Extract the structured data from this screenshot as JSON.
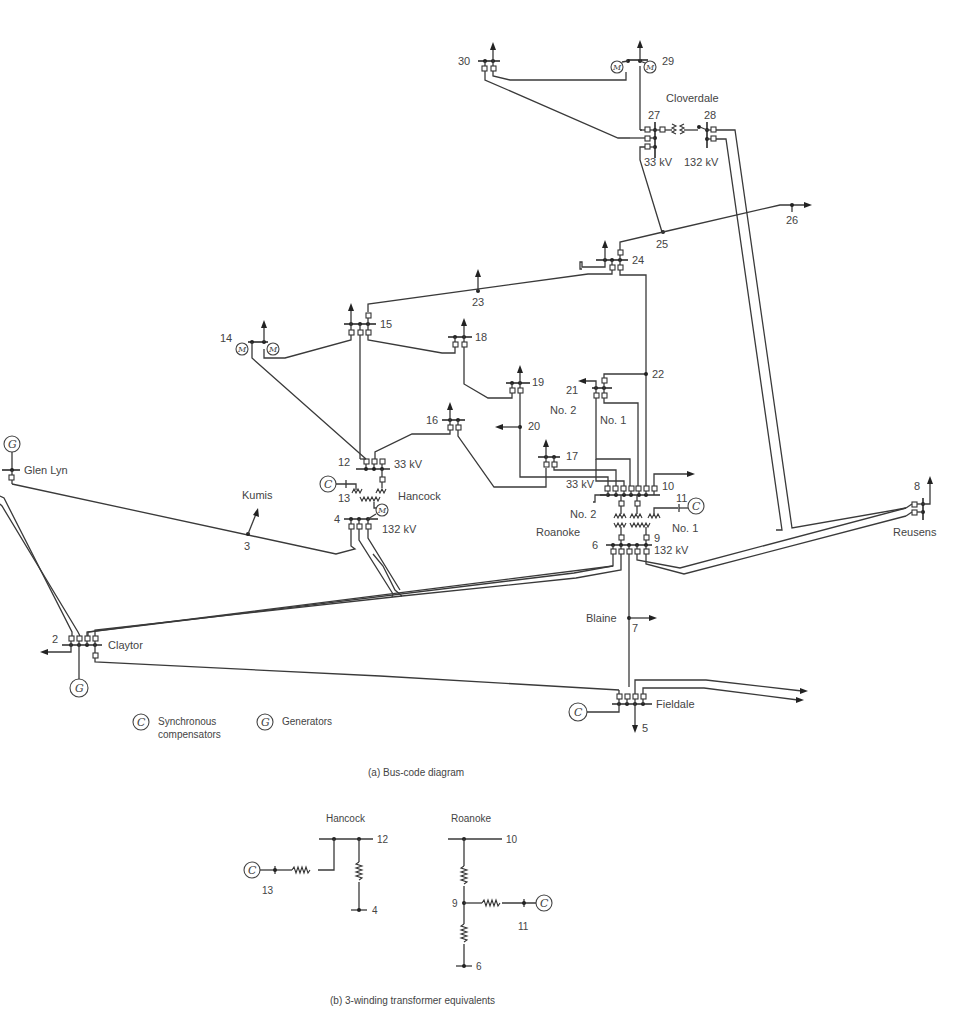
{
  "figure": {
    "caption_a": "(a)  Bus-code diagram",
    "caption_b": "(b)  3-winding transformer equivalents"
  },
  "stations": {
    "glen_lyn": "Glen Lyn",
    "kumis": "Kumis",
    "hancock": "Hancock",
    "claytor": "Claytor",
    "roanoke": "Roanoke",
    "blaine": "Blaine",
    "fieldale": "Fieldale",
    "reusens": "Reusens",
    "cloverdale": "Cloverdale"
  },
  "voltages": {
    "hancock_lv": "33 kV",
    "hancock_hv": "132 kV",
    "roanoke_lv": "33 kV",
    "roanoke_hv": "132 kV",
    "cloverdale_lv": "33 kV",
    "cloverdale_hv": "132 kV"
  },
  "transformer_labels": {
    "roanoke_no2_upper": "No. 2",
    "roanoke_no1_upper": "No. 1",
    "roanoke_no2_lower": "No. 2",
    "roanoke_no1_lower": "No. 1"
  },
  "buses": {
    "b2": "2",
    "b3": "3",
    "b4": "4",
    "b5": "5",
    "b6": "6",
    "b7": "7",
    "b8": "8",
    "b9": "9",
    "b10": "10",
    "b11": "11",
    "b12": "12",
    "b13": "13",
    "b14": "14",
    "b15": "15",
    "b16": "16",
    "b17": "17",
    "b18": "18",
    "b19": "19",
    "b20": "20",
    "b21": "21",
    "b22": "22",
    "b23": "23",
    "b24": "24",
    "b25": "25",
    "b26": "26",
    "b27": "27",
    "b28": "28",
    "b29": "29",
    "b30": "30"
  },
  "machine_symbols": {
    "generator": "G",
    "compensator": "C",
    "motor": "M"
  },
  "legend": {
    "compensator_line1": "Synchronous",
    "compensator_line2": "compensators",
    "generator": "Generators"
  },
  "equivalents": {
    "hancock": {
      "title": "Hancock",
      "bus_top": "12",
      "bus_comp": "13",
      "bus_bottom": "4"
    },
    "roanoke": {
      "title": "Roanoke",
      "bus_top": "10",
      "bus_mid": "9",
      "bus_comp": "11",
      "bus_bottom": "6"
    }
  }
}
